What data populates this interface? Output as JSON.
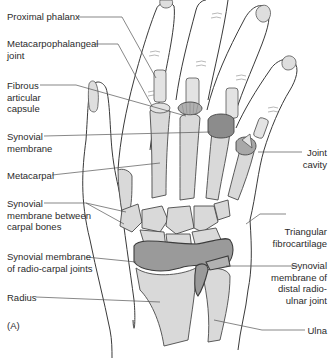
{
  "figure": {
    "panel_label": "(A)"
  },
  "labels_left": [
    {
      "id": "proximal-phalanx",
      "text": "Proximal phalanx"
    },
    {
      "id": "metacarpophalangeal-joint",
      "line1": "Metacarpophalangeal",
      "line2": "joint"
    },
    {
      "id": "fibrous-articular-capsule",
      "line1": "Fibrous",
      "line2": "articular",
      "line3": "capsule"
    },
    {
      "id": "synovial-membrane",
      "line1": "Synovial",
      "line2": "membrane"
    },
    {
      "id": "metacarpal",
      "text": "Metacarpal"
    },
    {
      "id": "synovial-membrane-carpal",
      "line1": "Synovial",
      "line2": "membrane between",
      "line3": "carpal bones"
    },
    {
      "id": "synovial-membrane-radiocarpal",
      "line1": "Synovial membrane",
      "line2": "of radio-carpal joints"
    },
    {
      "id": "radius",
      "text": "Radius"
    }
  ],
  "labels_right": [
    {
      "id": "joint-cavity",
      "line1": "Joint",
      "line2": "cavity"
    },
    {
      "id": "triangular-fibrocartilage",
      "line1": "Triangular",
      "line2": "fibrocartilage"
    },
    {
      "id": "synovial-membrane-distal-radioulnar",
      "line1": "Synovial",
      "line2": "membrane of",
      "line3": "distal radio-",
      "line4": "ulnar joint"
    },
    {
      "id": "ulna",
      "text": "Ulna"
    }
  ],
  "colors": {
    "bone": "#d9d9d9",
    "membrane": "#9a9a9a",
    "outline": "#3a3a3a",
    "text": "#2b2b2b"
  }
}
